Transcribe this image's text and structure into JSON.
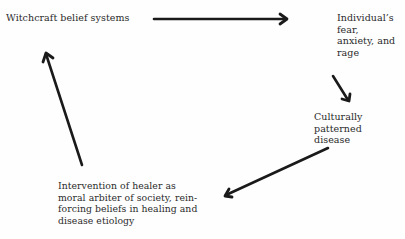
{
  "diagram": {
    "type": "cycle",
    "nodes": [
      {
        "id": "witchcraft",
        "label": "Witchcraft belief systems"
      },
      {
        "id": "fear",
        "label": "Individual’s fear,\nanxiety, and rage"
      },
      {
        "id": "disease",
        "label": "Culturally patterned\ndisease"
      },
      {
        "id": "healer",
        "label": "Intervention of healer as\nmoral arbiter of society, rein-\nforcing beliefs in healing and\ndisease etiology"
      }
    ],
    "edges": [
      {
        "from": "witchcraft",
        "to": "fear"
      },
      {
        "from": "fear",
        "to": "disease"
      },
      {
        "from": "disease",
        "to": "healer"
      },
      {
        "from": "healer",
        "to": "witchcraft"
      }
    ],
    "colors": {
      "arrow": "#1a1a1a",
      "text": "#2a2a2a",
      "background": "#fefefe"
    }
  }
}
